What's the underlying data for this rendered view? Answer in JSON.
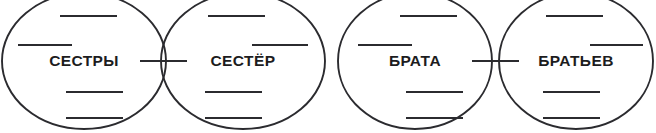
{
  "worksheet": {
    "background_color": "#ffffff",
    "stroke_color": "#2b2b2f",
    "text_color": "#1c1c20",
    "diagram_type": "venn-two-set-pair",
    "group_count": 2
  },
  "groups": [
    {
      "name": "sisters-group",
      "left": {
        "label": "СЕСТРЫ",
        "label_x": 84,
        "label_y": 61,
        "ellipse": {
          "cx": 84,
          "cy": 61,
          "rx": 82,
          "ry": 68
        },
        "lines": [
          {
            "x1": 60,
            "x2": 117,
            "y": 16
          },
          {
            "x1": 18,
            "x2": 72,
            "y": 45
          },
          {
            "x1": 66,
            "x2": 123,
            "y": 92
          },
          {
            "x1": 66,
            "x2": 123,
            "y": 118
          }
        ]
      },
      "right": {
        "label": "СЕСТЁР",
        "label_x": 243,
        "label_y": 61,
        "ellipse": {
          "cx": 243,
          "cy": 61,
          "rx": 82,
          "ry": 68
        },
        "lines": [
          {
            "x1": 208,
            "x2": 265,
            "y": 16
          },
          {
            "x1": 252,
            "x2": 308,
            "y": 45
          },
          {
            "x1": 205,
            "x2": 262,
            "y": 92
          },
          {
            "x1": 205,
            "x2": 262,
            "y": 118
          }
        ]
      },
      "intersection": {
        "line": {
          "x1": 140,
          "x2": 187,
          "y": 61
        }
      }
    },
    {
      "name": "brothers-group",
      "left": {
        "label": "БРАТА",
        "label_x": 415,
        "label_y": 61,
        "ellipse": {
          "cx": 415,
          "cy": 61,
          "rx": 77,
          "ry": 68
        },
        "lines": [
          {
            "x1": 400,
            "x2": 457,
            "y": 16
          },
          {
            "x1": 358,
            "x2": 412,
            "y": 45
          },
          {
            "x1": 406,
            "x2": 463,
            "y": 92
          },
          {
            "x1": 406,
            "x2": 463,
            "y": 118
          }
        ]
      },
      "right": {
        "label": "БРАТЬЕВ",
        "label_x": 576,
        "label_y": 61,
        "ellipse": {
          "cx": 576,
          "cy": 61,
          "rx": 77,
          "ry": 68
        },
        "lines": [
          {
            "x1": 546,
            "x2": 603,
            "y": 16
          },
          {
            "x1": 590,
            "x2": 643,
            "y": 45
          },
          {
            "x1": 543,
            "x2": 600,
            "y": 92
          },
          {
            "x1": 543,
            "x2": 600,
            "y": 118
          }
        ]
      },
      "intersection": {
        "line": {
          "x1": 472,
          "x2": 519,
          "y": 61
        }
      }
    }
  ]
}
